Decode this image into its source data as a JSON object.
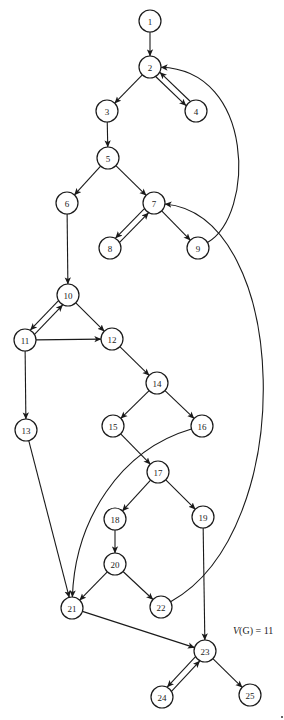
{
  "diagram": {
    "type": "control-flow-graph",
    "node_radius": 11,
    "colors": {
      "background": "#ffffff",
      "stroke": "#1a1a1a",
      "text": "#222222"
    },
    "nodes": [
      {
        "id": "1",
        "label": "1",
        "x": 150,
        "y": 21
      },
      {
        "id": "2",
        "label": "2",
        "x": 150,
        "y": 67
      },
      {
        "id": "3",
        "label": "3",
        "x": 107,
        "y": 111
      },
      {
        "id": "4",
        "label": "4",
        "x": 196,
        "y": 111
      },
      {
        "id": "5",
        "label": "5",
        "x": 108,
        "y": 158
      },
      {
        "id": "6",
        "label": "6",
        "x": 67,
        "y": 203
      },
      {
        "id": "7",
        "label": "7",
        "x": 154,
        "y": 203
      },
      {
        "id": "8",
        "label": "8",
        "x": 110,
        "y": 248
      },
      {
        "id": "9",
        "label": "9",
        "x": 198,
        "y": 248
      },
      {
        "id": "10",
        "label": "10",
        "x": 68,
        "y": 295
      },
      {
        "id": "11",
        "label": "11",
        "x": 25,
        "y": 340
      },
      {
        "id": "12",
        "label": "12",
        "x": 112,
        "y": 339
      },
      {
        "id": "13",
        "label": "13",
        "x": 26,
        "y": 430
      },
      {
        "id": "14",
        "label": "14",
        "x": 157,
        "y": 383
      },
      {
        "id": "15",
        "label": "15",
        "x": 113,
        "y": 426
      },
      {
        "id": "16",
        "label": "16",
        "x": 202,
        "y": 426
      },
      {
        "id": "17",
        "label": "17",
        "x": 158,
        "y": 472
      },
      {
        "id": "18",
        "label": "18",
        "x": 115,
        "y": 519
      },
      {
        "id": "19",
        "label": "19",
        "x": 203,
        "y": 517
      },
      {
        "id": "20",
        "label": "20",
        "x": 115,
        "y": 564
      },
      {
        "id": "21",
        "label": "21",
        "x": 72,
        "y": 608
      },
      {
        "id": "22",
        "label": "22",
        "x": 161,
        "y": 607
      },
      {
        "id": "23",
        "label": "23",
        "x": 205,
        "y": 651
      },
      {
        "id": "24",
        "label": "24",
        "x": 162,
        "y": 697
      },
      {
        "id": "25",
        "label": "25",
        "x": 250,
        "y": 695
      }
    ],
    "edges": [
      {
        "from": "1",
        "to": "2"
      },
      {
        "from": "2",
        "to": "3"
      },
      {
        "from": "2",
        "to": "4",
        "offset": 3
      },
      {
        "from": "4",
        "to": "2",
        "offset": 3
      },
      {
        "from": "3",
        "to": "5"
      },
      {
        "from": "5",
        "to": "6"
      },
      {
        "from": "5",
        "to": "7"
      },
      {
        "from": "6",
        "to": "10"
      },
      {
        "from": "7",
        "to": "8",
        "offset": 3
      },
      {
        "from": "8",
        "to": "7",
        "offset": 3
      },
      {
        "from": "7",
        "to": "9"
      },
      {
        "from": "9",
        "to": "2",
        "curve": {
          "c1": [
            255,
            215
          ],
          "c2": [
            255,
            70
          ]
        }
      },
      {
        "from": "10",
        "to": "11",
        "offset": 3
      },
      {
        "from": "11",
        "to": "10",
        "offset": 3
      },
      {
        "from": "10",
        "to": "12"
      },
      {
        "from": "11",
        "to": "12"
      },
      {
        "from": "11",
        "to": "13"
      },
      {
        "from": "12",
        "to": "14"
      },
      {
        "from": "14",
        "to": "15"
      },
      {
        "from": "14",
        "to": "16"
      },
      {
        "from": "15",
        "to": "17"
      },
      {
        "from": "16",
        "to": "21",
        "curve": {
          "c1": [
            120,
            450
          ],
          "c2": [
            75,
            520
          ]
        }
      },
      {
        "from": "17",
        "to": "18"
      },
      {
        "from": "17",
        "to": "19"
      },
      {
        "from": "18",
        "to": "20"
      },
      {
        "from": "19",
        "to": "23"
      },
      {
        "from": "20",
        "to": "21"
      },
      {
        "from": "20",
        "to": "22"
      },
      {
        "from": "13",
        "to": "21"
      },
      {
        "from": "22",
        "to": "7",
        "curve": {
          "c1": [
            300,
            530
          ],
          "c2": [
            290,
            215
          ]
        }
      },
      {
        "from": "21",
        "to": "23"
      },
      {
        "from": "23",
        "to": "24",
        "offset": 3
      },
      {
        "from": "24",
        "to": "23",
        "offset": 3
      },
      {
        "from": "23",
        "to": "25"
      }
    ]
  },
  "annotation": {
    "var": "V",
    "rest": "(G) = 11"
  }
}
